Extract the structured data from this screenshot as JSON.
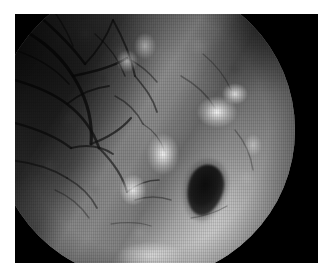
{
  "canvas": {
    "width": 333,
    "height": 280,
    "background_color": "#ffffff"
  },
  "viewer": {
    "label": "endoscopic-image-viewer",
    "frame_color": "#000000",
    "frame": {
      "x": 15,
      "y": 14,
      "width": 303,
      "height": 249
    },
    "modality": "endoscopy",
    "color_mode": "grayscale"
  },
  "field_of_view": {
    "shape": "circle",
    "center_x": 145,
    "center_y": 130,
    "radius": 150,
    "vignette": true,
    "corner_color": "#000000"
  },
  "scene": {
    "description": "Grayscale endoscopic view of mucosal tissue surface with a diagonal fold and a dark oval opening",
    "regions": [
      {
        "name": "upper-left-dark-mucosa",
        "brightness": "dark",
        "feature": "branching submucosal vascular network"
      },
      {
        "name": "diagonal-tissue-fold",
        "brightness": "bright",
        "feature": "ridge running from upper-left to lower-right"
      },
      {
        "name": "lower-bright-band",
        "brightness": "bright",
        "feature": "illuminated tissue surface"
      },
      {
        "name": "dark-oval-lesion",
        "brightness": "very dark",
        "feature": "oval cavity / ostium"
      }
    ],
    "highlights": [
      {
        "name": "specular-highlight-right",
        "x": 225,
        "y": 140
      },
      {
        "name": "specular-highlight-center",
        "x": 182,
        "y": 180
      },
      {
        "name": "specular-highlight-lower",
        "x": 155,
        "y": 215
      },
      {
        "name": "specular-highlight-upper",
        "x": 150,
        "y": 82
      }
    ],
    "lesion": {
      "name": "dark-oval-lesion",
      "center_x": 205,
      "center_y": 190,
      "width": 36,
      "height": 52,
      "rotation_deg": 18,
      "fill_color": "#0d0d0d"
    }
  }
}
